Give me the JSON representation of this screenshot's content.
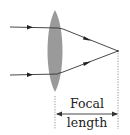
{
  "diagram": {
    "type": "convex-lens-focal-length",
    "labels": {
      "line1": "Focal",
      "line2": "length"
    },
    "colors": {
      "lens": "#9a9a9a",
      "ray": "#333333",
      "dimension": "#444444",
      "text": "#222222",
      "background": "#ffffff"
    },
    "elements": {
      "lens": {
        "shape": "biconvex",
        "cx": 55,
        "cy": 51,
        "rx": 9,
        "ry": 41
      },
      "rays": [
        {
          "name": "upper-ray",
          "incoming_y": 27,
          "exits_lens_at": [
            58,
            28
          ]
        },
        {
          "name": "lower-ray",
          "incoming_y": 75,
          "exits_lens_at": [
            58,
            73
          ]
        }
      ],
      "focal_point": [
        118,
        51
      ],
      "dimension_line": {
        "y": 114,
        "x_start": 56,
        "x_end": 118
      }
    }
  }
}
